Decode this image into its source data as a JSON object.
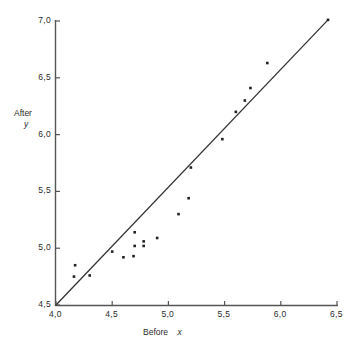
{
  "chart_data": {
    "type": "scatter",
    "title": "",
    "subtitle": "",
    "xlabel": "Before x",
    "ylabel": "After y",
    "xlim": [
      4.0,
      6.5
    ],
    "ylim": [
      4.5,
      7.0
    ],
    "xticks": [
      4.0,
      4.5,
      5.0,
      5.5,
      6.0,
      6.5
    ],
    "xtick_labels": [
      "4,0",
      "4,5",
      "5,0",
      "5,5",
      "6,0",
      "6,5"
    ],
    "yticks": [
      4.5,
      5.0,
      5.5,
      6.0,
      6.5,
      7.0
    ],
    "ytick_labels": [
      "4,5",
      "5,0",
      "5,5",
      "6,0",
      "6,5",
      "7,0"
    ],
    "grid": false,
    "legend": null,
    "marker": "square-dot",
    "marker_color": "#222222",
    "line_color": "#333333",
    "axis_color": "#555555",
    "series": [
      {
        "name": "observations",
        "type": "scatter",
        "points": [
          [
            4.17,
            4.85
          ],
          [
            4.16,
            4.75
          ],
          [
            4.3,
            4.76
          ],
          [
            4.5,
            4.97
          ],
          [
            4.6,
            4.92
          ],
          [
            4.69,
            4.93
          ],
          [
            4.78,
            5.06
          ],
          [
            4.7,
            5.14
          ],
          [
            4.7,
            5.02
          ],
          [
            4.78,
            5.02
          ],
          [
            4.9,
            5.09
          ],
          [
            5.09,
            5.3
          ],
          [
            5.18,
            5.44
          ],
          [
            5.2,
            5.71
          ],
          [
            5.48,
            5.96
          ],
          [
            5.6,
            6.2
          ],
          [
            5.68,
            6.3
          ],
          [
            5.73,
            6.41
          ],
          [
            5.88,
            6.63
          ],
          [
            6.42,
            7.01
          ]
        ]
      },
      {
        "name": "fitted-line",
        "type": "line",
        "points": [
          [
            4.0,
            4.5
          ],
          [
            6.42,
            7.01
          ]
        ]
      }
    ]
  },
  "axes": {
    "y_title_main": "After",
    "y_title_var": "y",
    "x_title_main": "Before",
    "x_title_var": "x"
  }
}
